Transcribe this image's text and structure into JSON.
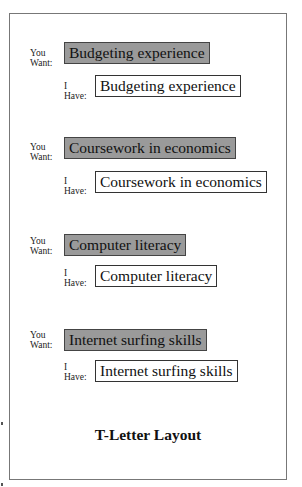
{
  "labels": {
    "want_line1": "You",
    "want_line2": "Want:",
    "have_line1": "I",
    "have_line2": "Have:"
  },
  "entries": [
    {
      "want": "Budgeting experience",
      "have": "Budgeting experience"
    },
    {
      "want": "Coursework in economics",
      "have": "Coursework in economics"
    },
    {
      "want": "Computer literacy",
      "have": "Computer literacy"
    },
    {
      "want": "Internet surfing skills",
      "have": "Internet surfing skills"
    }
  ],
  "caption": "T-Letter Layout",
  "colors": {
    "want_fill": "#9a9a9a",
    "have_fill": "#ffffff",
    "border": "#444444"
  }
}
